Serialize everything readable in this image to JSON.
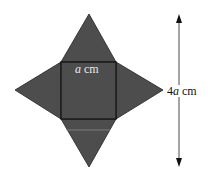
{
  "figure": {
    "fill_color": "#4d4d4d",
    "edge_color": "#111111",
    "square": {
      "x1": 61,
      "y1": 62,
      "x2": 116,
      "y2": 119
    },
    "apexes": {
      "top": [
        89,
        14
      ],
      "left": [
        15,
        90
      ],
      "right": [
        163,
        90
      ],
      "bottom": [
        89,
        167
      ]
    },
    "arrow": {
      "x": 179,
      "y_top": 14,
      "y_bottom": 167
    }
  },
  "labels": {
    "side_var": "a",
    "side_unit": " cm",
    "height_prefix": "4",
    "height_var": "a",
    "height_unit": " cm"
  }
}
